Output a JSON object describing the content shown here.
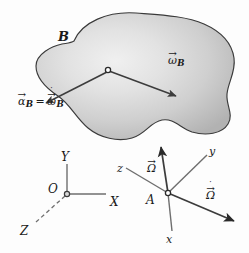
{
  "figure": {
    "background_color": "#fdfdfd",
    "ink_color": "#1a1a1a",
    "body_fill_light": "#e8e8e8",
    "body_fill_dark": "#b0b0b0",
    "body_outline_color": "#3a3a3a"
  },
  "body": {
    "label": "B",
    "node_label": "",
    "vectors": [
      {
        "name": "angular-velocity",
        "glyph": "ω",
        "subscript": "B",
        "accent_arrow": "→",
        "accent_dot": "",
        "direction": "down-right"
      },
      {
        "name": "angular-acceleration",
        "glyph": "α",
        "subscript": "B",
        "accent_arrow": "→",
        "accent_dot": "",
        "direction": "down-left"
      }
    ],
    "alpha_equation": {
      "lhs_glyph": "α",
      "lhs_subscript": "B",
      "equals": "=",
      "rhs_glyph": "ω",
      "rhs_subscript": "B",
      "rhs_accent_dot": "˙",
      "accent_arrow": "→"
    }
  },
  "fixed_frame": {
    "name": "XYZ",
    "origin_label": "O",
    "axes": [
      {
        "label": "Y",
        "direction": "up",
        "style": "solid"
      },
      {
        "label": "X",
        "direction": "right",
        "style": "solid"
      },
      {
        "label": "Z",
        "direction": "lower-left",
        "style": "dashed"
      }
    ]
  },
  "moving_frame": {
    "name": "xyz",
    "origin_label": "A",
    "axes": [
      {
        "label": "z",
        "direction": "upper-left",
        "style": "solid"
      },
      {
        "label": "y",
        "direction": "upper-right",
        "style": "solid"
      },
      {
        "label": "x",
        "direction": "down",
        "style": "solid"
      }
    ],
    "vectors": [
      {
        "name": "frame-angular-velocity",
        "glyph": "Ω",
        "accent_arrow": "→",
        "accent_dot": "",
        "direction": "up"
      },
      {
        "name": "frame-angular-acceleration",
        "glyph": "Ω",
        "accent_arrow": "→",
        "accent_dot": "˙",
        "direction": "lower-right"
      }
    ]
  }
}
